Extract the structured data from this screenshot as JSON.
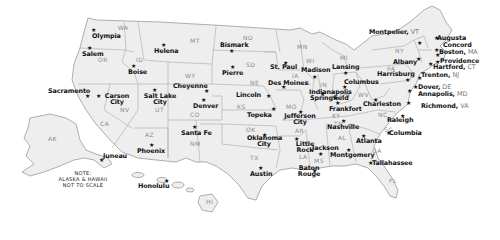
{
  "map": {
    "title": "United States State Capitals",
    "note": [
      "NOTE:",
      "ALASKA & HAWAII",
      "NOT TO SCALE"
    ],
    "colors": {
      "land": "#eeeeee",
      "outline": "#9a9a9a",
      "label": "#111111",
      "abbr": "#8a8a8a",
      "background": "#ffffff"
    },
    "state_abbreviations": [
      {
        "abbr": "WA",
        "x": 118,
        "y": 25
      },
      {
        "abbr": "OR",
        "x": 98,
        "y": 57
      },
      {
        "abbr": "ID",
        "x": 136,
        "y": 57
      },
      {
        "abbr": "MT",
        "x": 190,
        "y": 38
      },
      {
        "abbr": "ND",
        "x": 243,
        "y": 35
      },
      {
        "abbr": "MN",
        "x": 297,
        "y": 44
      },
      {
        "abbr": "SD",
        "x": 246,
        "y": 62
      },
      {
        "abbr": "WY",
        "x": 185,
        "y": 73
      },
      {
        "abbr": "NE",
        "x": 250,
        "y": 80
      },
      {
        "abbr": "IA",
        "x": 292,
        "y": 73
      },
      {
        "abbr": "WI",
        "x": 306,
        "y": 58
      },
      {
        "abbr": "MI",
        "x": 340,
        "y": 55
      },
      {
        "abbr": "NV",
        "x": 120,
        "y": 107
      },
      {
        "abbr": "UT",
        "x": 155,
        "y": 107
      },
      {
        "abbr": "CO",
        "x": 190,
        "y": 112
      },
      {
        "abbr": "KS",
        "x": 237,
        "y": 104
      },
      {
        "abbr": "MO",
        "x": 286,
        "y": 104
      },
      {
        "abbr": "IL",
        "x": 305,
        "y": 80
      },
      {
        "abbr": "IN",
        "x": 320,
        "y": 82
      },
      {
        "abbr": "OH",
        "x": 340,
        "y": 92
      },
      {
        "abbr": "WV",
        "x": 358,
        "y": 92
      },
      {
        "abbr": "KY",
        "x": 332,
        "y": 113
      },
      {
        "abbr": "TN",
        "x": 334,
        "y": 121
      },
      {
        "abbr": "NC",
        "x": 378,
        "y": 112
      },
      {
        "abbr": "SC",
        "x": 384,
        "y": 127
      },
      {
        "abbr": "CA",
        "x": 100,
        "y": 121
      },
      {
        "abbr": "AZ",
        "x": 145,
        "y": 132
      },
      {
        "abbr": "NM",
        "x": 190,
        "y": 141
      },
      {
        "abbr": "OK",
        "x": 246,
        "y": 127
      },
      {
        "abbr": "TX",
        "x": 250,
        "y": 155
      },
      {
        "abbr": "AR",
        "x": 295,
        "y": 128
      },
      {
        "abbr": "LA",
        "x": 299,
        "y": 154
      },
      {
        "abbr": "MS",
        "x": 314,
        "y": 158
      },
      {
        "abbr": "AL",
        "x": 338,
        "y": 135
      },
      {
        "abbr": "GA",
        "x": 372,
        "y": 148
      },
      {
        "abbr": "FL",
        "x": 389,
        "y": 178
      },
      {
        "abbr": "NY",
        "x": 395,
        "y": 48
      },
      {
        "abbr": "PA",
        "x": 387,
        "y": 66
      },
      {
        "abbr": "AK",
        "x": 48,
        "y": 136
      },
      {
        "abbr": "HI",
        "x": 206,
        "y": 199
      }
    ],
    "capitals": [
      {
        "name": "Olympia",
        "x": 92,
        "y": 33,
        "sx": 91,
        "sy": 27
      },
      {
        "name": "Salem",
        "x": 82,
        "y": 51,
        "sx": 87,
        "sy": 45
      },
      {
        "name": "Boise",
        "x": 128,
        "y": 69,
        "sx": 131,
        "sy": 63
      },
      {
        "name": "Helena",
        "x": 154,
        "y": 48,
        "sx": 161,
        "sy": 42
      },
      {
        "name": "Bismark",
        "x": 220,
        "y": 42,
        "sx": 229,
        "sy": 48
      },
      {
        "name": "Pierre",
        "x": 222,
        "y": 70,
        "sx": 230,
        "sy": 64
      },
      {
        "name": "Cheyenne",
        "x": 173,
        "y": 83,
        "sx": 204,
        "sy": 88
      },
      {
        "name": "Sacramento",
        "x": 48,
        "y": 88,
        "sx": 85,
        "sy": 93
      },
      {
        "name": "Carson City",
        "x": 100,
        "y": 93,
        "sx": 96,
        "sy": 93,
        "wrap": true
      },
      {
        "name": "Salt Lake City",
        "x": 143,
        "y": 93,
        "sx": 152,
        "sy": 87,
        "wrap": true
      },
      {
        "name": "Denver",
        "x": 193,
        "y": 103,
        "sx": 201,
        "sy": 97
      },
      {
        "name": "Lincoln",
        "x": 236,
        "y": 92,
        "sx": 266,
        "sy": 93
      },
      {
        "name": "Topeka",
        "x": 247,
        "y": 112,
        "sx": 271,
        "sy": 106
      },
      {
        "name": "St. Paul",
        "x": 270,
        "y": 64,
        "sx": 283,
        "sy": 60
      },
      {
        "name": "Des Moines",
        "x": 268,
        "y": 80,
        "sx": 281,
        "sy": 84
      },
      {
        "name": "Madison",
        "x": 301,
        "y": 67,
        "sx": 312,
        "sy": 74
      },
      {
        "name": "Lansing",
        "x": 332,
        "y": 64,
        "sx": 343,
        "sy": 70
      },
      {
        "name": "Springfield",
        "x": 310,
        "y": 95,
        "sx": 320,
        "sy": 91
      },
      {
        "name": "Indianapolis",
        "x": 309,
        "y": 89,
        "sx": 333,
        "sy": 95
      },
      {
        "name": "Columbus",
        "x": 344,
        "y": 79,
        "sx": 342,
        "sy": 84
      },
      {
        "name": "Jefferson City",
        "x": 283,
        "y": 113,
        "sx": 298,
        "sy": 109,
        "wrap": true
      },
      {
        "name": "Frankfort",
        "x": 329,
        "y": 106,
        "sx": 335,
        "sy": 100
      },
      {
        "name": "Charleston",
        "x": 363,
        "y": 101,
        "sx": 373,
        "sy": 97
      },
      {
        "name": "Nashville",
        "x": 327,
        "y": 124,
        "sx": 341,
        "sy": 118
      },
      {
        "name": "Raleigh",
        "x": 387,
        "y": 117,
        "sx": 400,
        "sy": 113
      },
      {
        "name": "Columbia",
        "x": 389,
        "y": 130,
        "sx": 386,
        "sy": 130
      },
      {
        "name": "Atlanta",
        "x": 356,
        "y": 138,
        "sx": 361,
        "sy": 133
      },
      {
        "name": "Montgomery",
        "x": 330,
        "y": 152,
        "sx": 346,
        "sy": 147
      },
      {
        "name": "Jackson",
        "x": 312,
        "y": 145,
        "sx": 318,
        "sy": 151
      },
      {
        "name": "Tallahassee",
        "x": 372,
        "y": 160,
        "sx": 368,
        "sy": 160
      },
      {
        "name": "Baton Rouge",
        "x": 292,
        "y": 165,
        "sx": 312,
        "sy": 168,
        "wrap": true
      },
      {
        "name": "Little Rock",
        "x": 288,
        "y": 141,
        "sx": 294,
        "sy": 136,
        "wrap": true
      },
      {
        "name": "Oklahoma City",
        "x": 247,
        "y": 135,
        "sx": 262,
        "sy": 132,
        "wrap": true
      },
      {
        "name": "Austin",
        "x": 250,
        "y": 171,
        "sx": 258,
        "sy": 165
      },
      {
        "name": "Santa Fe",
        "x": 181,
        "y": 130,
        "sx": 192,
        "sy": 124
      },
      {
        "name": "Phoenix",
        "x": 137,
        "y": 148,
        "sx": 149,
        "sy": 142
      },
      {
        "name": "Juneau",
        "x": 103,
        "y": 153,
        "sx": 99,
        "sy": 157
      },
      {
        "name": "Honolulu",
        "x": 138,
        "y": 183,
        "sx": 164,
        "sy": 178
      },
      {
        "name": "Montpelier",
        "x": 369,
        "y": 29,
        "state": "VT",
        "sx": 417,
        "sy": 40
      },
      {
        "name": "Augusta",
        "x": 437,
        "y": 35,
        "sx": 434,
        "sy": 35
      },
      {
        "name": "Concord",
        "x": 443,
        "y": 42,
        "sx": 434,
        "sy": 47
      },
      {
        "name": "Boston",
        "x": 439,
        "y": 49,
        "state": "MA",
        "sx": 435,
        "sy": 52
      },
      {
        "name": "Albany",
        "x": 393,
        "y": 59,
        "sx": 416,
        "sy": 56
      },
      {
        "name": "Providence",
        "x": 440,
        "y": 58,
        "sx": 435,
        "sy": 59
      },
      {
        "name": "Hartford",
        "x": 433,
        "y": 64,
        "state": "CT",
        "sx": 428,
        "sy": 61
      },
      {
        "name": "Harrisburg",
        "x": 377,
        "y": 71,
        "sx": 405,
        "sy": 77
      },
      {
        "name": "Trenton",
        "x": 421,
        "y": 72,
        "state": "NJ",
        "sx": 417,
        "sy": 75
      },
      {
        "name": "Dover",
        "x": 418,
        "y": 84,
        "state": "DE",
        "sx": 413,
        "sy": 84
      },
      {
        "name": "Annapolis",
        "x": 418,
        "y": 91,
        "state": "MD",
        "sx": 407,
        "sy": 88
      },
      {
        "name": "Richmond",
        "x": 421,
        "y": 103,
        "state": "VA",
        "sx": 406,
        "sy": 100
      }
    ]
  }
}
